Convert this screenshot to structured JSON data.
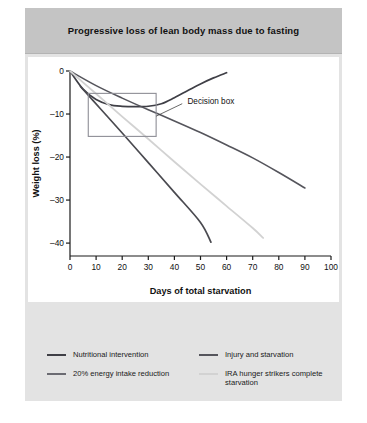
{
  "figure": {
    "title": "Progressive loss of lean body mass due to fasting",
    "panel_bg": "#e3e3e3",
    "title_bg": "#c4c4c4",
    "plot_bg": "#ffffff"
  },
  "chart_data": {
    "type": "line",
    "title": "Progressive loss of lean body mass due to fasting",
    "xlabel": "Days of total starvation",
    "ylabel": "Weight loss (%)",
    "xlim": [
      0,
      100
    ],
    "ylim": [
      -43,
      0
    ],
    "xticks": [
      0,
      10,
      20,
      30,
      40,
      50,
      60,
      70,
      80,
      90,
      100
    ],
    "yticks": [
      0,
      -10,
      -20,
      -30,
      -40
    ],
    "xticklabels": [
      "0",
      "10",
      "20",
      "30",
      "40",
      "50",
      "60",
      "70",
      "80",
      "90",
      "100"
    ],
    "yticklabels": [
      "0",
      "–10",
      "–20",
      "–30",
      "–40"
    ],
    "grid": false,
    "legend_position": "below",
    "series": [
      {
        "name": "Nutritional intervention",
        "color": "#3f3f46",
        "width": 1.7,
        "points": [
          [
            0,
            0
          ],
          [
            5,
            -4.2
          ],
          [
            10,
            -6.6
          ],
          [
            15,
            -7.8
          ],
          [
            20,
            -8.2
          ],
          [
            25,
            -8.3
          ],
          [
            30,
            -8.2
          ],
          [
            35,
            -7.6
          ],
          [
            40,
            -6.2
          ],
          [
            45,
            -4.6
          ],
          [
            50,
            -3.0
          ],
          [
            55,
            -1.6
          ],
          [
            60,
            -0.4
          ]
        ]
      },
      {
        "name": "Injury and starvation",
        "color": "#55555c",
        "width": 1.6,
        "points": [
          [
            0,
            0
          ],
          [
            10,
            -3.4
          ],
          [
            20,
            -6.3
          ],
          [
            30,
            -9.0
          ],
          [
            40,
            -11.6
          ],
          [
            50,
            -14.3
          ],
          [
            60,
            -17.2
          ],
          [
            70,
            -20.2
          ],
          [
            80,
            -23.6
          ],
          [
            90,
            -27.2
          ]
        ]
      },
      {
        "name": "20% energy intake reduction",
        "color": "#4a4a50",
        "width": 1.7,
        "points": [
          [
            4,
            -3.6
          ],
          [
            12,
            -9.0
          ],
          [
            20,
            -14.4
          ],
          [
            30,
            -21.3
          ],
          [
            40,
            -28.2
          ],
          [
            50,
            -35.2
          ],
          [
            54,
            -39.8
          ]
        ]
      },
      {
        "name": "IRA hunger strikers complete starvation",
        "color": "#d2d2d2",
        "width": 1.8,
        "points": [
          [
            0,
            0
          ],
          [
            10,
            -5.3
          ],
          [
            20,
            -10.6
          ],
          [
            30,
            -15.8
          ],
          [
            40,
            -21.1
          ],
          [
            50,
            -26.3
          ],
          [
            60,
            -31.4
          ],
          [
            70,
            -36.5
          ],
          [
            74,
            -38.8
          ]
        ]
      }
    ],
    "annotations": [
      {
        "name": "decision-box",
        "label": "Decision box",
        "rect": {
          "x0": 7,
          "x1": 33,
          "y0": -5.2,
          "y1": -15.2
        },
        "label_xy": [
          45,
          -7.0
        ],
        "leader_from": [
          33,
          -10.5
        ],
        "leader_to": [
          43,
          -7.6
        ],
        "box_color": "#8e8e96"
      }
    ]
  },
  "legend": {
    "columns": [
      [
        {
          "label": "Nutritional intervention",
          "color": "#3f3f46"
        },
        {
          "label": "20% energy intake reduction",
          "color": "#6b6b72"
        }
      ],
      [
        {
          "label": "Injury and starvation",
          "color": "#55555c"
        },
        {
          "label": "IRA hunger strikers complete starvation",
          "color": "#d2d2d2"
        }
      ]
    ]
  }
}
